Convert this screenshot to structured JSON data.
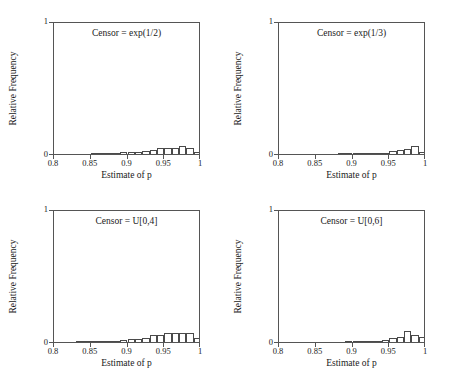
{
  "figure": {
    "width": 449,
    "height": 376,
    "background": "#ffffff",
    "line_color": "#555555",
    "bar_edge_color": "#4a4a4a",
    "bar_fill_color": "#ffffff",
    "text_color": "#1a1a1a",
    "layout": "2x2 grid of histogram panels"
  },
  "chart_data": [
    {
      "type": "bar",
      "title": "Censor = exp(1/2)",
      "xlabel": "Estimate of p",
      "ylabel": "Relative Frequency",
      "xlim": [
        0.8,
        1.0
      ],
      "ylim": [
        0.0,
        1.0
      ],
      "xticks": [
        0.8,
        0.85,
        0.9,
        0.95,
        1.0
      ],
      "xticklabels": [
        "0.8",
        "0.85",
        "0.9",
        "0.95",
        "1"
      ],
      "yticks": [
        0.0,
        1.0
      ],
      "yticklabels": [
        "0",
        "1"
      ],
      "grid": false,
      "legend": null,
      "bin_width": 0.01,
      "bin_left_edges": [
        0.8,
        0.81,
        0.82,
        0.83,
        0.84,
        0.85,
        0.86,
        0.87,
        0.88,
        0.89,
        0.9,
        0.91,
        0.92,
        0.93,
        0.94,
        0.95,
        0.96,
        0.97,
        0.98,
        0.99
      ],
      "categories": [
        "0.80",
        "0.81",
        "0.82",
        "0.83",
        "0.84",
        "0.85",
        "0.86",
        "0.87",
        "0.88",
        "0.89",
        "0.90",
        "0.91",
        "0.92",
        "0.93",
        "0.94",
        "0.95",
        "0.96",
        "0.97",
        "0.98",
        "0.99"
      ],
      "values": [
        0.0,
        0.0,
        0.0,
        0.0,
        0.002,
        0.004,
        0.005,
        0.007,
        0.009,
        0.012,
        0.018,
        0.018,
        0.022,
        0.032,
        0.047,
        0.048,
        0.047,
        0.062,
        0.048,
        0.016,
        0.675
      ]
    },
    {
      "type": "bar",
      "title": "Censor = exp(1/3)",
      "xlabel": "Estimate of p",
      "ylabel": "Relative Frequency",
      "xlim": [
        0.8,
        1.0
      ],
      "ylim": [
        0.0,
        1.0
      ],
      "xticks": [
        0.8,
        0.85,
        0.9,
        0.95,
        1.0
      ],
      "xticklabels": [
        "0.8",
        "0.85",
        "0.9",
        "0.95",
        "1"
      ],
      "yticks": [
        0.0,
        1.0
      ],
      "yticklabels": [
        "0",
        "1"
      ],
      "grid": false,
      "legend": null,
      "bin_width": 0.01,
      "categories": [
        "0.80",
        "0.81",
        "0.82",
        "0.83",
        "0.84",
        "0.85",
        "0.86",
        "0.87",
        "0.88",
        "0.89",
        "0.90",
        "0.91",
        "0.92",
        "0.93",
        "0.94",
        "0.95",
        "0.96",
        "0.97",
        "0.98",
        "0.99"
      ],
      "values": [
        0.0,
        0.0,
        0.0,
        0.0,
        0.0,
        0.001,
        0.002,
        0.002,
        0.003,
        0.004,
        0.009,
        0.006,
        0.007,
        0.009,
        0.011,
        0.02,
        0.028,
        0.036,
        0.06,
        0.013,
        0.79
      ]
    },
    {
      "type": "bar",
      "title": "Censor = U[0,4]",
      "xlabel": "Estimate of p",
      "ylabel": "Relative Frequency",
      "xlim": [
        0.8,
        1.0
      ],
      "ylim": [
        0.0,
        1.0
      ],
      "xticks": [
        0.8,
        0.85,
        0.9,
        0.95,
        1.0
      ],
      "xticklabels": [
        "0.8",
        "0.85",
        "0.9",
        "0.95",
        "1"
      ],
      "yticks": [
        0.0,
        1.0
      ],
      "yticklabels": [
        "0",
        "1"
      ],
      "grid": false,
      "legend": null,
      "bin_width": 0.01,
      "categories": [
        "0.80",
        "0.81",
        "0.82",
        "0.83",
        "0.84",
        "0.85",
        "0.86",
        "0.87",
        "0.88",
        "0.89",
        "0.90",
        "0.91",
        "0.92",
        "0.93",
        "0.94",
        "0.95",
        "0.96",
        "0.97",
        "0.98",
        "0.99"
      ],
      "values": [
        0.0,
        0.0,
        0.002,
        0.003,
        0.004,
        0.005,
        0.006,
        0.008,
        0.011,
        0.014,
        0.026,
        0.026,
        0.031,
        0.052,
        0.052,
        0.069,
        0.066,
        0.07,
        0.07,
        0.03,
        0.415
      ]
    },
    {
      "type": "bar",
      "title": "Censor = U[0,6]",
      "xlabel": "Estimate of p",
      "ylabel": "Relative Frequency",
      "xlim": [
        0.8,
        1.0
      ],
      "ylim": [
        0.0,
        1.0
      ],
      "xticks": [
        0.8,
        0.85,
        0.9,
        0.95,
        1.0
      ],
      "xticklabels": [
        "0.8",
        "0.85",
        "0.9",
        "0.95",
        "1"
      ],
      "yticks": [
        0.0,
        1.0
      ],
      "yticklabels": [
        "0",
        "1"
      ],
      "grid": false,
      "legend": null,
      "bin_width": 0.01,
      "categories": [
        "0.80",
        "0.81",
        "0.82",
        "0.83",
        "0.84",
        "0.85",
        "0.86",
        "0.87",
        "0.88",
        "0.89",
        "0.90",
        "0.91",
        "0.92",
        "0.93",
        "0.94",
        "0.95",
        "0.96",
        "0.97",
        "0.98",
        "0.99"
      ],
      "values": [
        0.0,
        0.0,
        0.0,
        0.0,
        0.0,
        0.001,
        0.001,
        0.002,
        0.002,
        0.003,
        0.005,
        0.004,
        0.006,
        0.011,
        0.018,
        0.029,
        0.036,
        0.081,
        0.056,
        0.034,
        0.62
      ]
    }
  ]
}
